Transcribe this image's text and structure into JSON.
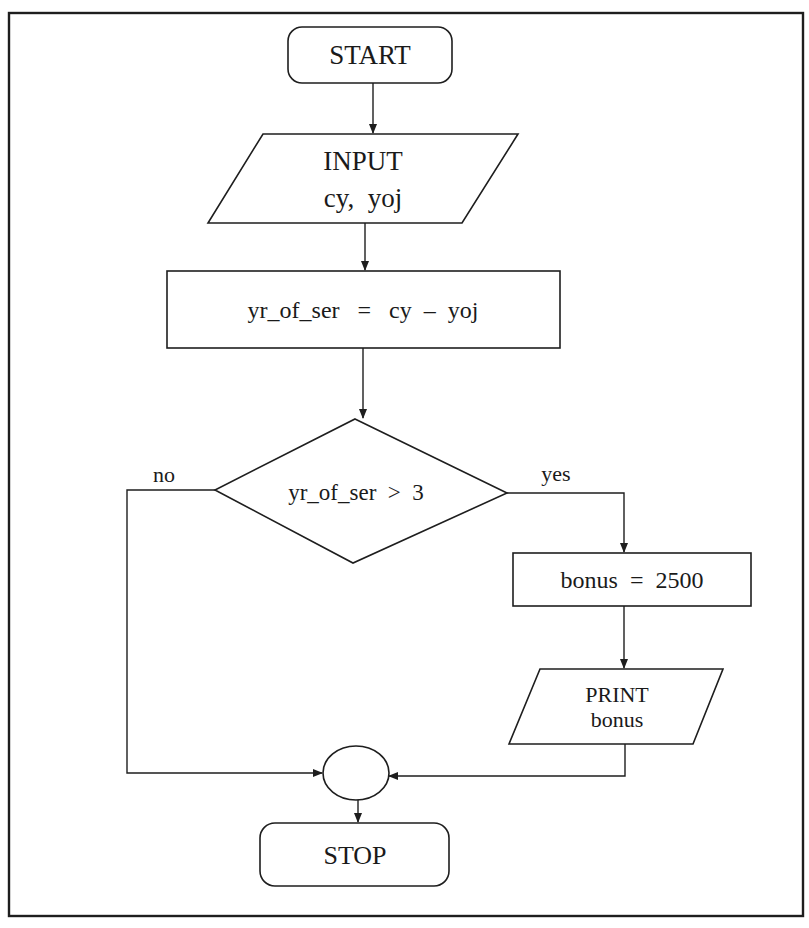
{
  "diagram": {
    "type": "flowchart",
    "colors": {
      "stroke": "#1e1e1e",
      "text": "#1a1a1a",
      "background": "#ffffff"
    },
    "nodes": {
      "start": {
        "shape": "terminal",
        "label": "START"
      },
      "input": {
        "shape": "io-parallelogram",
        "line1": "INPUT",
        "line2": "cy,  yoj"
      },
      "compute": {
        "shape": "process",
        "label": "yr_of_ser   =   cy  –  yoj"
      },
      "decision": {
        "shape": "decision-diamond",
        "label": "yr_of_ser  >  3"
      },
      "assign_bonus": {
        "shape": "process",
        "label": "bonus  =  2500"
      },
      "print": {
        "shape": "io-parallelogram",
        "line1": "PRINT",
        "line2": "bonus"
      },
      "connector": {
        "shape": "connector-circle",
        "label": ""
      },
      "stop": {
        "shape": "terminal",
        "label": "STOP"
      }
    },
    "edges": [
      {
        "from": "start",
        "to": "input",
        "label": ""
      },
      {
        "from": "input",
        "to": "compute",
        "label": ""
      },
      {
        "from": "compute",
        "to": "decision",
        "label": ""
      },
      {
        "from": "decision",
        "to": "assign_bonus",
        "label": "yes"
      },
      {
        "from": "decision",
        "to": "connector",
        "label": "no"
      },
      {
        "from": "assign_bonus",
        "to": "print",
        "label": ""
      },
      {
        "from": "print",
        "to": "connector",
        "label": ""
      },
      {
        "from": "connector",
        "to": "stop",
        "label": ""
      }
    ],
    "branch_labels": {
      "yes": "yes",
      "no": "no"
    }
  }
}
